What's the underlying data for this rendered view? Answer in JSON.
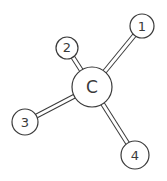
{
  "diagram": {
    "type": "molecular-structure",
    "center_atom": {
      "label": "C",
      "x": 92,
      "y": 87,
      "r": 20,
      "font_size": 17
    },
    "substituents": [
      {
        "label": "1",
        "x": 142,
        "y": 26,
        "r": 12,
        "font_size": 13
      },
      {
        "label": "2",
        "x": 67,
        "y": 48,
        "r": 11,
        "font_size": 13
      },
      {
        "label": "3",
        "x": 25,
        "y": 122,
        "r": 13,
        "font_size": 13
      },
      {
        "label": "4",
        "x": 135,
        "y": 155,
        "r": 14,
        "font_size": 13
      }
    ],
    "colors": {
      "line": "#3a3a3a",
      "background": "#ffffff"
    }
  }
}
